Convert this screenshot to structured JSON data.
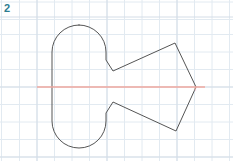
{
  "page": {
    "width": 233,
    "height": 161,
    "background_color": "#ffffff"
  },
  "problem": {
    "number": "2",
    "number_color": "#2d7d8f"
  },
  "grid": {
    "spacing": 17.5,
    "line_color": "#dfe7ef",
    "major_line_color": "#d2dce6",
    "visible": true
  },
  "figure": {
    "name": "symmetric-compound-shape",
    "stroke_color": "#555555",
    "stroke_width": 1,
    "fill": "none",
    "capsule": {
      "left": 52,
      "right": 106,
      "top": 25,
      "bottom": 148,
      "radius": 27
    },
    "notch": {
      "upper_vertex_x": 113,
      "upper_vertex_y": 71,
      "lower_vertex_x": 113,
      "lower_vertex_y": 102
    },
    "polygon_vertices": [
      {
        "x": 175,
        "y": 43,
        "name": "top-right"
      },
      {
        "x": 196,
        "y": 87,
        "name": "right-apex"
      },
      {
        "x": 176,
        "y": 131,
        "name": "bottom-right"
      }
    ]
  },
  "axis": {
    "name": "line-of-symmetry",
    "color": "#f0a9a0",
    "y": 87,
    "x_start": 37,
    "x_end": 205,
    "stroke_width": 1.4,
    "label": "ℓ"
  }
}
